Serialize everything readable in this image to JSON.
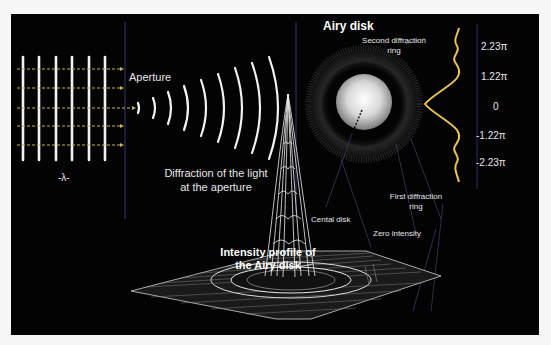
{
  "diagram": {
    "title_airy": "Airy disk",
    "aperture_label": "Aperture",
    "wavelength_label": "-λ-",
    "diffraction_caption": [
      "Diffraction of the light",
      "at the aperture"
    ],
    "second_ring_label": [
      "Second diffraction",
      "ring"
    ],
    "first_ring_label": [
      "First diffraction",
      "ring"
    ],
    "central_disk_label": "Cental disk",
    "zero_intensity_label": "Zero intensity",
    "intensity_title": [
      "Intensity profile of",
      "the Airy disk"
    ],
    "axis_ticks": [
      "2.23π",
      "1.22π",
      "0",
      "-1.22π",
      "-2.23π"
    ],
    "colors": {
      "background": "#030303",
      "profile_curve": "#e8c25a",
      "arrows": "#c9b45a",
      "divider": "#3a3a6a",
      "wave": "#ffffff"
    }
  }
}
